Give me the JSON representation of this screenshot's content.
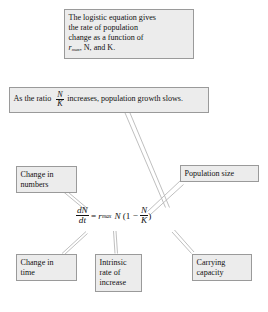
{
  "diagram": {
    "title_box": {
      "name": "logistic-equation-description",
      "lines": [
        "The logistic equation gives",
        "the rate of population",
        "change as a function of"
      ],
      "last_line_prefix": "r",
      "last_line_subscript": "max",
      "last_line_suffix": ", N, and K."
    },
    "ratio_box": {
      "name": "ratio-statement",
      "text_before": "As the ratio",
      "fraction_numerator": "N",
      "fraction_denominator": "K",
      "text_after": "increases, population growth slows."
    },
    "labels": {
      "change_in_numbers": [
        "Change in",
        "numbers"
      ],
      "population_size": [
        "Population size"
      ],
      "change_in_time": [
        "Change in",
        "time"
      ],
      "intrinsic_rate": [
        "Intrinsic",
        "rate of",
        "increase"
      ],
      "carrying_capacity": [
        "Carrying",
        "capacity"
      ]
    },
    "equation": {
      "lhs_numerator": "dN",
      "lhs_denominator": "dt",
      "equals": "=",
      "rate_symbol": "r",
      "rate_subscript": "max",
      "population_symbol": "N",
      "open_paren": "(",
      "one": "1",
      "minus": "−",
      "ratio_numerator": "N",
      "ratio_denominator": "K",
      "close_paren": ")"
    },
    "colors": {
      "box_fill": "#ececec",
      "box_border": "#9a9a9a",
      "text": "#111111",
      "connector": "#b6b6b6"
    }
  }
}
